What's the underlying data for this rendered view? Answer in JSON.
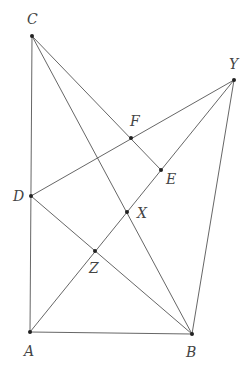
{
  "diagram": {
    "type": "geometry",
    "points": [
      {
        "id": "C",
        "label": "C",
        "x": 32,
        "y": 36,
        "lx": 27,
        "ly": 24
      },
      {
        "id": "Y",
        "label": "Y",
        "x": 234,
        "y": 80,
        "lx": 229,
        "ly": 69
      },
      {
        "id": "F",
        "label": "F",
        "x": 131,
        "y": 138,
        "lx": 130,
        "ly": 126
      },
      {
        "id": "E",
        "label": "E",
        "x": 161,
        "y": 170,
        "lx": 166,
        "ly": 184
      },
      {
        "id": "D",
        "label": "D",
        "x": 31,
        "y": 196,
        "lx": 13,
        "ly": 201
      },
      {
        "id": "X",
        "label": "X",
        "x": 127,
        "y": 212,
        "lx": 137,
        "ly": 218
      },
      {
        "id": "Z",
        "label": "Z",
        "x": 95,
        "y": 251,
        "lx": 89,
        "ly": 273
      },
      {
        "id": "A",
        "label": "A",
        "x": 30,
        "y": 332,
        "lx": 24,
        "ly": 356
      },
      {
        "id": "B",
        "label": "B",
        "x": 192,
        "y": 334,
        "lx": 186,
        "ly": 357
      }
    ],
    "segments": [
      [
        "C",
        "A"
      ],
      [
        "A",
        "B"
      ],
      [
        "B",
        "Y"
      ],
      [
        "C",
        "E"
      ],
      [
        "C",
        "B"
      ],
      [
        "D",
        "Y"
      ],
      [
        "A",
        "Y"
      ],
      [
        "D",
        "B"
      ]
    ],
    "colors": {
      "line": "#555555",
      "point": "#222222",
      "label": "#444444"
    }
  }
}
